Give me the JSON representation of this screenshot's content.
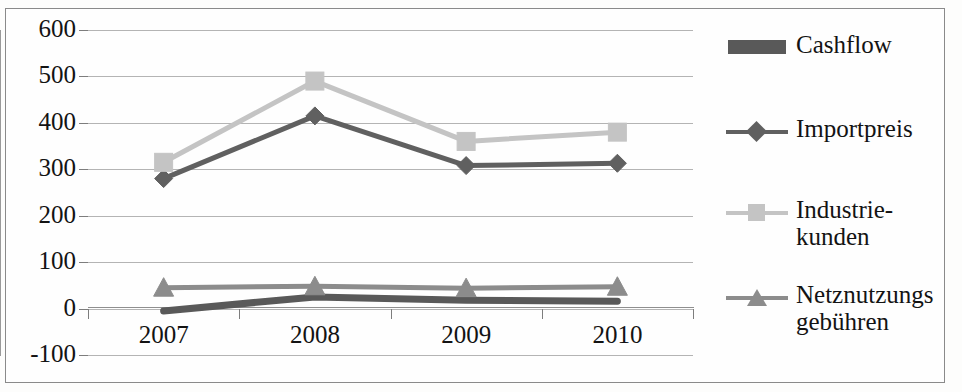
{
  "chart_data": {
    "type": "line",
    "title": "",
    "xlabel": "",
    "ylabel": "",
    "categories": [
      "2007",
      "2008",
      "2009",
      "2010"
    ],
    "ylim": [
      -100,
      600
    ],
    "yticks": [
      600,
      500,
      400,
      300,
      200,
      100,
      0,
      -100
    ],
    "grid": true,
    "legend_position": "right",
    "series": [
      {
        "name": "Cashflow",
        "values": [
          -5,
          25,
          18,
          16
        ],
        "color": "#595959",
        "marker": "none",
        "legend_style": "bar"
      },
      {
        "name": "Importpreis",
        "values": [
          280,
          415,
          308,
          313
        ],
        "color": "#606060",
        "marker": "diamond",
        "legend_style": "line"
      },
      {
        "name": "Industrie-\nkunden",
        "values": [
          315,
          490,
          360,
          380
        ],
        "color": "#c4c4c4",
        "marker": "square",
        "legend_style": "line"
      },
      {
        "name": "Netznutzungs\ngebühren",
        "values": [
          45,
          48,
          44,
          47
        ],
        "color": "#8c8c8c",
        "marker": "triangle",
        "legend_style": "line"
      }
    ]
  },
  "axis": {
    "y_tick_labels": [
      "600",
      "500",
      "400",
      "300",
      "200",
      "100",
      "0",
      "-100"
    ],
    "x_tick_labels": [
      "2007",
      "2008",
      "2009",
      "2010"
    ]
  },
  "legend": {
    "items": [
      {
        "label": "Cashflow"
      },
      {
        "label": "Importpreis"
      },
      {
        "label": "Industrie-\nkunden"
      },
      {
        "label": "Netznutzungs\ngebühren"
      }
    ]
  },
  "colors": {
    "cashflow": "#595959",
    "importpreis": "#606060",
    "industriekunden": "#c4c4c4",
    "netznutzungsgebuehren": "#8c8c8c",
    "gridline": "#b4b4b4",
    "axis": "#8f8f8f",
    "text": "#131313"
  }
}
